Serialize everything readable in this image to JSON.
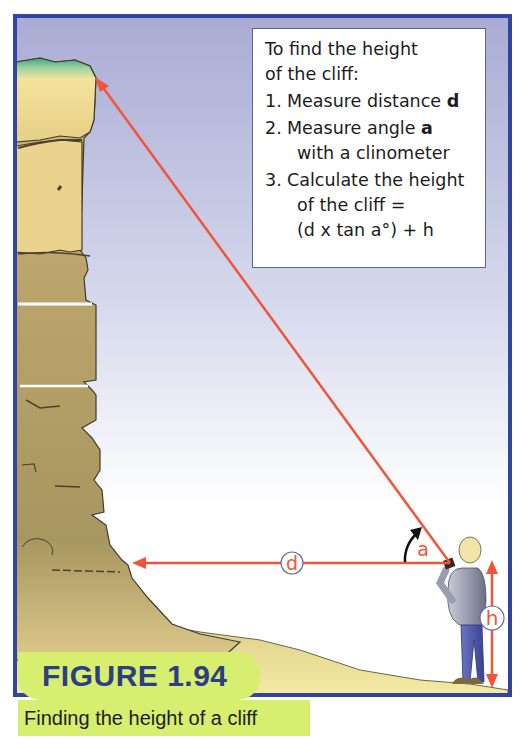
{
  "instructions": {
    "title_line1": "To find the height",
    "title_line2": "of the cliff:",
    "steps": [
      {
        "num": "1.",
        "text": "Measure distance ",
        "var": "d"
      },
      {
        "num": "2.",
        "text": "Measure angle ",
        "var": "a",
        "line2": "with a clinometer"
      },
      {
        "num": "3.",
        "text": "Calculate the height",
        "line2": "of the cliff =",
        "line3": "(d x tan a°) + h"
      }
    ]
  },
  "diagram": {
    "label_d": "d",
    "label_a": "a",
    "label_h": "h",
    "colors": {
      "frame": "#2f45a0",
      "sky_top": "#aeb0d6",
      "sky_bottom": "#ffffff",
      "cliff": "#b8a46a",
      "cliff_top": "#f2e19a",
      "grass": "#4fb08a",
      "ground": "#f1e59a",
      "measure_line": "#f0553a",
      "label_circle": "#6b6f93"
    }
  },
  "figure": {
    "label": "FIGURE 1.94",
    "caption": "Finding the height of a cliff"
  }
}
